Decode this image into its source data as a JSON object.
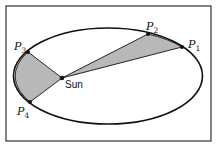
{
  "figure": {
    "colors": {
      "background": "#ffffff",
      "frame": "#333333",
      "orbit": "#111111",
      "shaded_area": "#b8b8b8",
      "points": "#111111"
    },
    "frame": {
      "x": 6,
      "y": 6,
      "width": 205,
      "height": 135
    },
    "orbit": {
      "cx": 108,
      "cy": 76,
      "rx": 94.5,
      "ry": 48
    },
    "sun": {
      "label": "Sun",
      "x": 62,
      "y": 78
    },
    "points": [
      {
        "id": "P1",
        "letter": "P",
        "sub": "1",
        "x": 182,
        "y": 47
      },
      {
        "id": "P2",
        "letter": "P",
        "sub": "2",
        "x": 148,
        "y": 34
      },
      {
        "id": "P3",
        "letter": "P",
        "sub": "3",
        "x": 28,
        "y": 52
      },
      {
        "id": "P4",
        "letter": "P",
        "sub": "4",
        "x": 30,
        "y": 102
      }
    ],
    "shaded_regions": [
      {
        "name": "sector-P2-P1",
        "from": "P2",
        "to": "P1"
      },
      {
        "name": "sector-P3-P4",
        "from": "P3",
        "to": "P4"
      }
    ]
  }
}
